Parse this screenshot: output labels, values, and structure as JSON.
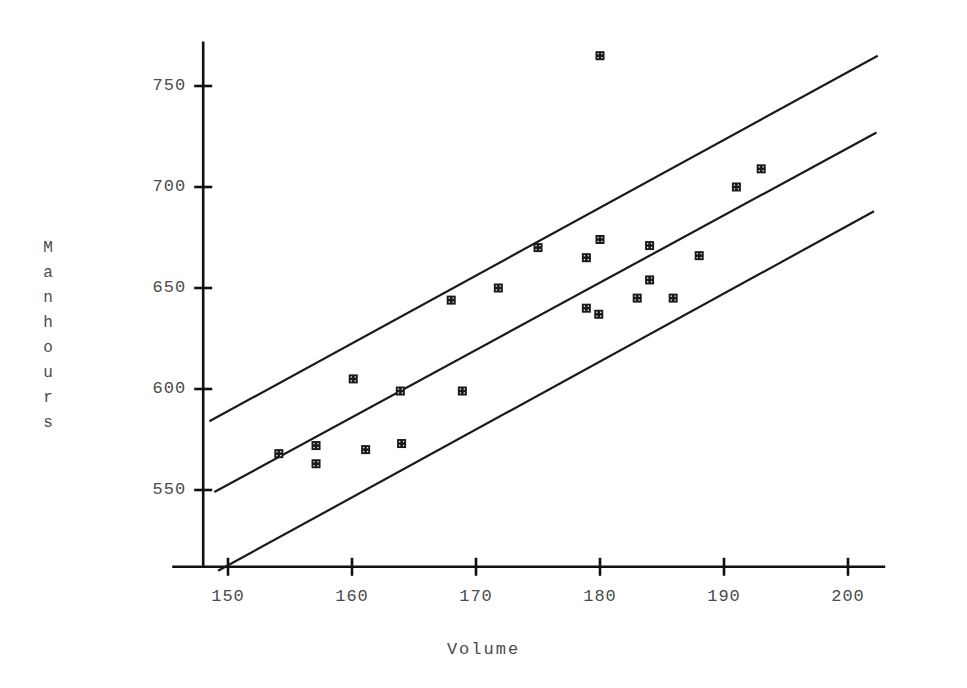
{
  "chart_data": {
    "type": "scatter",
    "title": "",
    "subtitle": "",
    "xlabel": "Volume",
    "ylabel": "Manhours",
    "ylabel_letters": [
      "M",
      "a",
      "n",
      "h",
      "o",
      "u",
      "r",
      "s"
    ],
    "xlim": [
      146,
      203
    ],
    "ylim": [
      512,
      772
    ],
    "xticks": [
      150,
      160,
      170,
      180,
      190,
      200
    ],
    "yticks": [
      550,
      600,
      650,
      700,
      750
    ],
    "xtick_labels": [
      "150",
      "160",
      "170",
      "180",
      "190",
      "200"
    ],
    "ytick_labels": [
      "550",
      "600",
      "650",
      "700",
      "750"
    ],
    "grid": false,
    "legend": "none",
    "marker_style": "filled-square-crosshatch",
    "marker_color": "#1a1a1a",
    "line_color": "#1a1a1a",
    "axis_color": "#111111",
    "points": [
      {
        "x": 154.1,
        "y": 568
      },
      {
        "x": 157.1,
        "y": 572
      },
      {
        "x": 157.1,
        "y": 563
      },
      {
        "x": 160.1,
        "y": 605
      },
      {
        "x": 161.1,
        "y": 570
      },
      {
        "x": 164.0,
        "y": 573
      },
      {
        "x": 163.9,
        "y": 599
      },
      {
        "x": 168.0,
        "y": 644
      },
      {
        "x": 168.9,
        "y": 599
      },
      {
        "x": 171.8,
        "y": 650
      },
      {
        "x": 175.0,
        "y": 670
      },
      {
        "x": 178.9,
        "y": 665
      },
      {
        "x": 180.0,
        "y": 674
      },
      {
        "x": 178.9,
        "y": 640
      },
      {
        "x": 179.9,
        "y": 637
      },
      {
        "x": 183.0,
        "y": 645
      },
      {
        "x": 184.0,
        "y": 671
      },
      {
        "x": 184.0,
        "y": 654
      },
      {
        "x": 185.9,
        "y": 645
      },
      {
        "x": 188.0,
        "y": 666
      },
      {
        "x": 191.0,
        "y": 700
      },
      {
        "x": 193.0,
        "y": 709
      },
      {
        "x": 180.0,
        "y": 765
      }
    ],
    "lines": [
      {
        "name": "upper-band",
        "x1": 148.5,
        "y1": 584,
        "x2": 202.4,
        "y2": 765
      },
      {
        "name": "fit-line",
        "x1": 148.9,
        "y1": 549,
        "x2": 202.3,
        "y2": 727
      },
      {
        "name": "lower-band",
        "x1": 149.2,
        "y1": 510,
        "x2": 202.1,
        "y2": 688
      }
    ],
    "axes": {
      "x_axis_y_value": 512,
      "x_axis_start": 145.5,
      "x_axis_end": 203.0,
      "y_axis_x_value": 148.0,
      "y_axis_top": 772,
      "y_axis_bottom": 512
    }
  }
}
